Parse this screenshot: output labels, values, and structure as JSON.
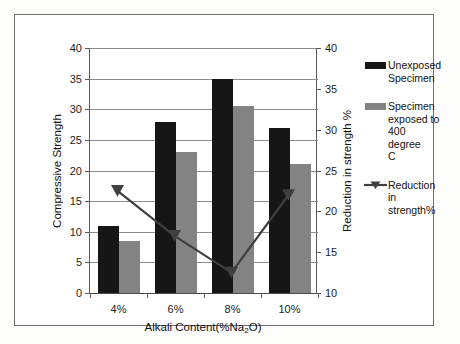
{
  "chart_data": {
    "type": "bar",
    "title": "",
    "categories": [
      "4%",
      "6%",
      "8%",
      "10%"
    ],
    "xlabel": "Alkali Content(%Na2O)",
    "xlabel_main": "Alkali Content(%Na",
    "xlabel_sub": "2",
    "xlabel_tail": "O)",
    "ylabel": "Compressive Strength",
    "ylabel_secondary": "Reduction in strength %",
    "ylim": [
      0,
      40
    ],
    "ylim_secondary": [
      10,
      40
    ],
    "yticks": [
      0,
      5,
      10,
      15,
      20,
      25,
      30,
      35,
      40
    ],
    "yticks_secondary": [
      10,
      15,
      20,
      25,
      30,
      35,
      40
    ],
    "grid": true,
    "legend_position": "right",
    "series": [
      {
        "name": "Unexposed Specimen",
        "type": "bar",
        "axis": "left",
        "color": "#161616",
        "values": [
          11,
          28,
          35,
          27
        ]
      },
      {
        "name": "Specimen exposed to 400 degree C",
        "type": "bar",
        "axis": "left",
        "color": "#838383",
        "values": [
          8.5,
          23,
          30.5,
          21
        ]
      },
      {
        "name": "Reduction in strength%",
        "type": "line",
        "axis": "right",
        "color": "#3f3f3f",
        "marker": "triangle",
        "values": [
          22.5,
          17,
          12.5,
          22
        ]
      }
    ]
  },
  "legend": {
    "items": [
      {
        "label_lines": [
          "Unexposed",
          "Specimen"
        ],
        "swatch": "#161616",
        "marker": "bar"
      },
      {
        "label_lines": [
          "Specimen",
          "exposed to",
          "400 degree",
          "C"
        ],
        "swatch": "#838383",
        "marker": "bar"
      },
      {
        "label_lines": [
          "Reduction",
          "in",
          "strength%"
        ],
        "swatch": "#3f3f3f",
        "marker": "line-triangle"
      }
    ],
    "item0_label": "Unexposed Specimen",
    "item1_label": "Specimen exposed to 400 degree C",
    "item2_label": "Reduction in strength%"
  },
  "axes": {
    "left_title": "Compressive Strength",
    "right_title": "Reduction in strength %",
    "x_title_prefix": "Alkali Content(%Na",
    "x_title_sub": "2",
    "x_title_suffix": "O)",
    "left_ticks": [
      "40",
      "35",
      "30",
      "25",
      "20",
      "15",
      "10",
      "5",
      "0"
    ],
    "right_ticks": [
      "40",
      "35",
      "30",
      "25",
      "20",
      "15",
      "10"
    ],
    "x_ticks": [
      "4%",
      "6%",
      "8%",
      "10%"
    ]
  }
}
